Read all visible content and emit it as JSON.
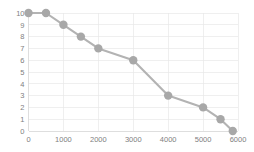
{
  "chart_data": {
    "type": "line",
    "title": "",
    "subtitle": "",
    "xlabel": "",
    "ylabel": "",
    "xlim": [
      0,
      6000
    ],
    "ylim": [
      0,
      10
    ],
    "grid": true,
    "legend": false,
    "legend_position": "none",
    "x_ticks": [
      0,
      1000,
      2000,
      3000,
      4000,
      5000,
      6000
    ],
    "x_tick_labels": [
      "0",
      "1000",
      "2000",
      "3000",
      "4000",
      "5000",
      "6000"
    ],
    "y_ticks": [
      0,
      1,
      2,
      3,
      4,
      5,
      6,
      7,
      8,
      9,
      10
    ],
    "y_tick_labels": [
      "0",
      "1",
      "2",
      "3",
      "4",
      "5",
      "6",
      "7",
      "8",
      "9",
      "10"
    ],
    "marker": "circle",
    "marker_color": "#a8a8a8",
    "line_color": "#b3b3b3",
    "grid_color": "#e8e8e8",
    "background_color": "#ffffff",
    "series": [
      {
        "name": "series-1",
        "x": [
          0,
          500,
          1000,
          1500,
          2000,
          3000,
          4000,
          5000,
          5500,
          5850
        ],
        "values": [
          10,
          10,
          9,
          8,
          7,
          6,
          3,
          2,
          1,
          0
        ]
      }
    ]
  }
}
